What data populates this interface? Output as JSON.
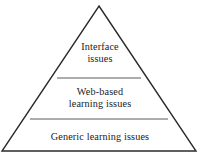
{
  "diagram": {
    "type": "pyramid",
    "title": "",
    "orientation": "apex-up",
    "tier_count": 3,
    "colors": {
      "background": "#ffffff",
      "outline": "#2b2b2b",
      "divider": "#555555",
      "text": "#1b1b1b"
    },
    "tiers": [
      {
        "id": "interface",
        "level": 1,
        "position": "top",
        "label": "Interface issues",
        "lines": [
          "Interface",
          "issues"
        ]
      },
      {
        "id": "web-based-learning",
        "level": 2,
        "position": "middle",
        "label": "Web-based learning issues",
        "lines": [
          "Web-based",
          "learning issues"
        ]
      },
      {
        "id": "generic-learning",
        "level": 3,
        "position": "bottom",
        "label": "Generic learning issues",
        "lines": [
          "Generic learning issues"
        ]
      }
    ],
    "geometry": {
      "apex": [
        99,
        6
      ],
      "base_left": [
        2,
        151
      ],
      "base_right": [
        196,
        151
      ],
      "divider_upper_y": 78,
      "divider_upper_x": [
        57,
        141
      ],
      "divider_lower_y": 119,
      "divider_lower_x": [
        30,
        168
      ]
    }
  }
}
